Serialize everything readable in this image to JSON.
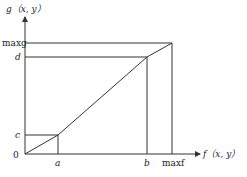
{
  "diagram": {
    "type": "piecewise linear mapping",
    "y_axis_label": "g（x, y）",
    "x_axis_label": "f（x, y）",
    "origin_label": "0",
    "y_ticks": [
      {
        "label": "maxg",
        "value": "maxg"
      },
      {
        "label": "d",
        "value": "d"
      },
      {
        "label": "c",
        "value": "c"
      }
    ],
    "x_ticks": [
      {
        "label": "a",
        "value": "a"
      },
      {
        "label": "b",
        "value": "b"
      },
      {
        "label": "maxf",
        "value": "maxf"
      }
    ],
    "segments": [
      {
        "from": [
          "0",
          "0"
        ],
        "to": [
          "a",
          "c"
        ]
      },
      {
        "from": [
          "a",
          "c"
        ],
        "to": [
          "b",
          "d"
        ]
      },
      {
        "from": [
          "b",
          "d"
        ],
        "to": [
          "maxf",
          "maxg"
        ]
      }
    ],
    "colors": {
      "line": "#333333",
      "text": "#222222",
      "background": "#ffffff"
    }
  }
}
